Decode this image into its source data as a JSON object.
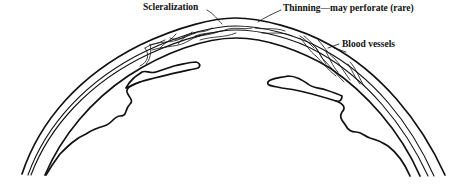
{
  "figure": {
    "labels": [
      {
        "id": "scleralization",
        "text": "Scleralization"
      },
      {
        "id": "thinning",
        "text": "Thinning—may perforate (rare)"
      },
      {
        "id": "blood_vessels",
        "text": "Blood vessels"
      }
    ],
    "colors": {
      "stroke": "#111111",
      "background": "#ffffff"
    }
  }
}
